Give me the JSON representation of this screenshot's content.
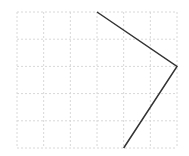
{
  "chart_data": {
    "type": "line",
    "title": "",
    "xlabel": "",
    "ylabel": "",
    "grid": true,
    "grid_style": "dotted",
    "grid_columns": 6,
    "grid_rows": 5,
    "xlim": [
      0,
      6
    ],
    "ylim": [
      0,
      5
    ],
    "series": [
      {
        "name": "",
        "color": "#333333",
        "points": [
          [
            3,
            5
          ],
          [
            6,
            3
          ],
          [
            4,
            0
          ]
        ]
      }
    ]
  },
  "colors": {
    "grid": "#d8d8d8",
    "line": "#333333",
    "background": "#ffffff"
  }
}
